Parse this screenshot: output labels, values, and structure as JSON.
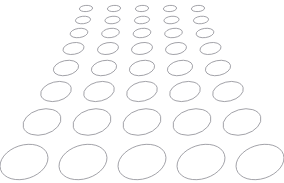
{
  "figure": {
    "background_color": "#ffffff",
    "stroke_color": "#8a8a92",
    "stroke_width": 0.8,
    "fill": "none",
    "canvas": {
      "width": 284,
      "height": 183
    },
    "rows_count": 8,
    "columns_count": 5
  },
  "chart_data": {
    "type": "scatter",
    "xlabel": "",
    "ylabel": "",
    "xlim": [
      0,
      284
    ],
    "ylim": [
      0,
      183
    ],
    "grid": false,
    "legend": "none",
    "marker": "ellipse-outline",
    "rows": [
      {
        "row": 1,
        "cy": 8.5,
        "rx": 6.6,
        "ry": 3.1,
        "rotation": -4,
        "cx": [
          86,
          114,
          142,
          170,
          198
        ]
      },
      {
        "row": 2,
        "cy": 20.0,
        "rx": 7.6,
        "ry": 3.7,
        "rotation": -6,
        "cx": [
          83,
          112.5,
          142,
          171.5,
          201
        ]
      },
      {
        "row": 3,
        "cy": 33.0,
        "rx": 8.9,
        "ry": 4.6,
        "rotation": -8,
        "cx": [
          79,
          110.5,
          142,
          173.5,
          205
        ]
      },
      {
        "row": 4,
        "cy": 48.5,
        "rx": 10.6,
        "ry": 5.8,
        "rotation": -10,
        "cx": [
          73.5,
          108,
          142,
          176,
          210.5
        ]
      },
      {
        "row": 5,
        "cy": 68.0,
        "rx": 12.8,
        "ry": 7.4,
        "rotation": -12,
        "cx": [
          66,
          104,
          142,
          180,
          218
        ]
      },
      {
        "row": 6,
        "cy": 91.5,
        "rx": 15.6,
        "ry": 9.6,
        "rotation": -14,
        "cx": [
          56,
          99,
          142,
          185,
          228
        ]
      },
      {
        "row": 7,
        "cy": 122.0,
        "rx": 19.4,
        "ry": 12.6,
        "rotation": -16,
        "cx": [
          42,
          92,
          142,
          192,
          242
        ]
      },
      {
        "row": 8,
        "cy": 162.0,
        "rx": 24.6,
        "ry": 16.8,
        "rotation": -18,
        "cx": [
          24,
          83,
          142,
          201,
          260
        ]
      }
    ]
  }
}
